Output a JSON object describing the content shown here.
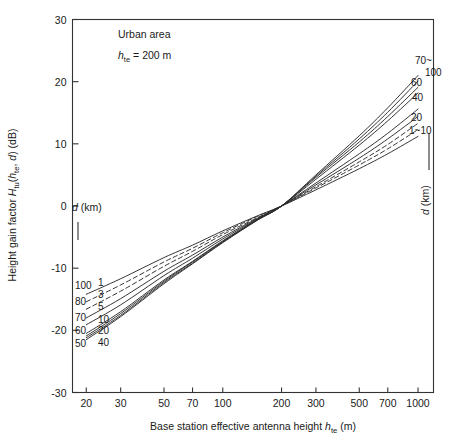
{
  "figure": {
    "width": 457,
    "height": 445,
    "background": "#ffffff",
    "ink_color": "#2b2b2b"
  },
  "annotations": {
    "area_label": "Urban area",
    "hte_label_prefix": "h",
    "hte_label_sub": "te",
    "hte_label_value": " = 200 m",
    "left_pointer_label": "d (km)",
    "right_pointer_label": "d (km)"
  },
  "axes": {
    "x_title_main": "Base station effective antenna height ",
    "x_title_var": "h",
    "x_title_sub": "te",
    "x_title_unit": " (m)",
    "y_title_main": "Height gain factor ",
    "y_title_var1": "H",
    "y_title_sub1": "tu",
    "y_title_mid": "(",
    "y_title_var2": "h",
    "y_title_sub2": "te",
    "y_title_comma": ", ",
    "y_title_var3": "d",
    "y_title_close": ") (dB)"
  },
  "chart_data": {
    "type": "line",
    "title": "",
    "subtitle": "Urban area, h_te = 200 m",
    "xlabel": "Base station effective antenna height h_te (m)",
    "ylabel": "Height gain factor H_tu(h_te, d) (dB)",
    "xscale": "log",
    "xlim": [
      17,
      1200
    ],
    "ylim": [
      -30,
      30
    ],
    "xticks": [
      20,
      30,
      50,
      70,
      100,
      200,
      300,
      500,
      700,
      1000
    ],
    "xticklabels": [
      "20",
      "30",
      "50",
      "70",
      "100",
      "200",
      "300",
      "500",
      "700",
      "1000"
    ],
    "yticks": [
      -30,
      -20,
      -10,
      0,
      10,
      20,
      30
    ],
    "yticklabels": [
      "-30",
      "-20",
      "-10",
      "0",
      "10",
      "20",
      "30"
    ],
    "grid": false,
    "legend": "inline-curve-end-labels",
    "convergence_point": {
      "x": 200,
      "y": 0
    },
    "left_labels_outer": [
      "100",
      "80",
      "70",
      "60",
      "50"
    ],
    "left_labels_inner": [
      "1",
      "3",
      "5",
      "10",
      "20",
      "40"
    ],
    "right_labels": [
      "70~",
      "100",
      "60",
      "40",
      "20",
      "1~10"
    ],
    "series": [
      {
        "name": "1",
        "d_km": 1,
        "style": "solid",
        "x": [
          20,
          30,
          50,
          70,
          100,
          150,
          200,
          300,
          500,
          700,
          1000
        ],
        "y": [
          -14.2,
          -11.7,
          -8.3,
          -6.3,
          -4.0,
          -1.6,
          0.0,
          2.6,
          6.0,
          8.4,
          11.2
        ]
      },
      {
        "name": "3",
        "d_km": 3,
        "style": "dashed",
        "x": [
          20,
          30,
          50,
          70,
          100,
          150,
          200,
          300,
          500,
          700,
          1000
        ],
        "y": [
          -15.4,
          -12.7,
          -9.0,
          -6.8,
          -4.3,
          -1.7,
          0.0,
          2.9,
          6.6,
          9.2,
          12.3
        ]
      },
      {
        "name": "5",
        "d_km": 5,
        "style": "dashed",
        "x": [
          20,
          30,
          50,
          70,
          100,
          150,
          200,
          300,
          500,
          700,
          1000
        ],
        "y": [
          -16.6,
          -13.7,
          -9.7,
          -7.3,
          -4.6,
          -1.9,
          0.0,
          3.1,
          7.1,
          9.9,
          13.3
        ]
      },
      {
        "name": "10",
        "d_km": 10,
        "style": "solid",
        "x": [
          20,
          30,
          50,
          70,
          100,
          150,
          200,
          300,
          500,
          700,
          1000
        ],
        "y": [
          -18.0,
          -14.9,
          -10.5,
          -7.9,
          -5.0,
          -2.0,
          0.0,
          3.4,
          7.7,
          10.8,
          14.4
        ]
      },
      {
        "name": "20",
        "d_km": 20,
        "style": "solid",
        "x": [
          20,
          30,
          50,
          70,
          100,
          150,
          200,
          300,
          500,
          700,
          1000
        ],
        "y": [
          -19.1,
          -15.9,
          -11.2,
          -8.4,
          -5.3,
          -2.1,
          0.0,
          3.7,
          8.4,
          11.7,
          15.6
        ]
      },
      {
        "name": "40",
        "d_km": 40,
        "style": "solid",
        "x": [
          20,
          30,
          50,
          70,
          100,
          150,
          200,
          300,
          500,
          700,
          1000
        ],
        "y": [
          -20.5,
          -17.0,
          -11.9,
          -8.9,
          -5.6,
          -2.2,
          0.0,
          4.3,
          9.8,
          13.7,
          18.2
        ]
      },
      {
        "name": "50",
        "d_km": 50,
        "style": "solid",
        "x": [
          20,
          30,
          50,
          70,
          100,
          150,
          200,
          300,
          500,
          700,
          1000
        ],
        "y": [
          -20.9,
          -17.3,
          -12.1,
          -9.0,
          -5.7,
          -2.2,
          0.0,
          4.6,
          10.3,
          14.4,
          19.1
        ]
      },
      {
        "name": "60",
        "d_km": 60,
        "style": "solid",
        "x": [
          20,
          30,
          50,
          70,
          100,
          150,
          200,
          300,
          500,
          700,
          1000
        ],
        "y": [
          -21.2,
          -17.6,
          -12.3,
          -9.2,
          -5.8,
          -2.3,
          0.0,
          4.8,
          10.8,
          15.1,
          20.1
        ]
      },
      {
        "name": "70-100",
        "d_km": 100,
        "style": "solid",
        "x": [
          20,
          30,
          50,
          70,
          100,
          150,
          200,
          300,
          500,
          700,
          1000
        ],
        "y": [
          -21.5,
          -17.8,
          -12.5,
          -9.3,
          -5.9,
          -2.3,
          0.0,
          5.0,
          11.3,
          15.8,
          21.0
        ]
      }
    ]
  }
}
